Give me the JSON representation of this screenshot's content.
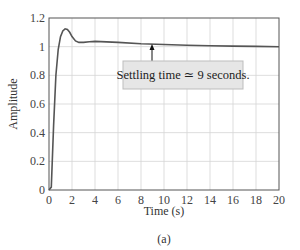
{
  "chart_data": {
    "type": "line",
    "title": "",
    "xlabel": "Time (s)",
    "ylabel": "Amplitude",
    "caption": "(a)",
    "xlim": [
      0,
      20
    ],
    "ylim": [
      0,
      1.2
    ],
    "xticks": [
      0,
      2,
      4,
      6,
      8,
      10,
      12,
      14,
      16,
      18,
      20
    ],
    "yticks": [
      0,
      0.2,
      0.4,
      0.6,
      0.8,
      1,
      1.2
    ],
    "xtick_labels": [
      "0",
      "2",
      "4",
      "6",
      "8",
      "10",
      "12",
      "14",
      "16",
      "18",
      "20"
    ],
    "ytick_labels": [
      "0",
      "0.2",
      "0.4",
      "0.6",
      "0.8",
      "1",
      "1.2"
    ],
    "grid": true,
    "series": [
      {
        "name": "Step response",
        "color": "#555555",
        "x": [
          0,
          0.2,
          0.4,
          0.6,
          0.8,
          1.0,
          1.2,
          1.4,
          1.6,
          1.8,
          2.0,
          2.3,
          2.6,
          3.0,
          3.5,
          4.0,
          5.0,
          6.0,
          8.0,
          10.0,
          12.0,
          14.0,
          16.0,
          18.0,
          20.0
        ],
        "y": [
          0,
          0.02,
          0.45,
          0.8,
          0.98,
          1.07,
          1.11,
          1.125,
          1.12,
          1.1,
          1.07,
          1.04,
          1.03,
          1.03,
          1.035,
          1.037,
          1.033,
          1.03,
          1.02,
          1.015,
          1.01,
          1.007,
          1.004,
          1.002,
          1.0
        ]
      }
    ],
    "annotations": [
      {
        "text": "Settling time ≃ 9 seconds.",
        "arrow_to": {
          "x": 9,
          "y": 1.02
        }
      }
    ]
  }
}
